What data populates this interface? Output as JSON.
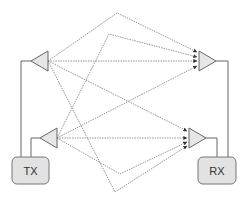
{
  "diagram": {
    "title": "",
    "nodes": {
      "tx": {
        "label": "TX"
      },
      "rx": {
        "label": "RX"
      }
    },
    "colors": {
      "line": "#555555",
      "dotted": "#777777",
      "fill": "#e6e6e6",
      "box_fill": "#e2e2e2"
    }
  }
}
